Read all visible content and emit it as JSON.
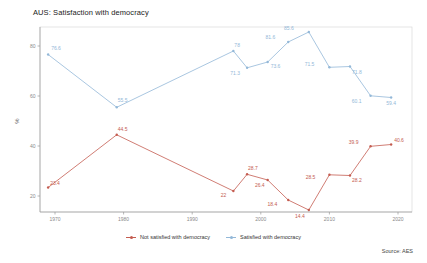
{
  "title": "AUS: Satisfaction with democracy",
  "source": "Source: AES",
  "legend": {
    "not_satisfied_label": "Not satisfied with democracy",
    "satisfied_label": "Satisfied with democracy"
  },
  "colors": {
    "not_satisfied": "#c45c50",
    "satisfied": "#93b8d8",
    "axis": "#9a9a9a",
    "panel_border": "#d9d9d9",
    "tick_text": "#8a8a8a"
  },
  "chart_data": {
    "type": "line",
    "title": "AUS: Satisfaction with democracy",
    "xlabel": "",
    "ylabel": "%",
    "x": [
      1969,
      1979,
      1996,
      1998,
      2001,
      2004,
      2007,
      2010,
      2013,
      2016,
      2019
    ],
    "series": [
      {
        "name": "Not satisfied with democracy",
        "color": "#c45c50",
        "values": [
          23.4,
          44.5,
          22,
          28.7,
          26.4,
          18.4,
          14.4,
          28.5,
          28.2,
          39.9,
          40.6
        ]
      },
      {
        "name": "Satisfied with democracy",
        "color": "#93b8d8",
        "values": [
          76.6,
          55.5,
          78,
          71.3,
          73.6,
          81.6,
          85.6,
          71.5,
          71.8,
          60.1,
          59.4
        ]
      }
    ],
    "xticks": [
      1970,
      1980,
      1990,
      2000,
      2010,
      2020
    ],
    "yticks": [
      20,
      40,
      60,
      80
    ],
    "xlim": [
      1967.8,
      2022
    ],
    "ylim": [
      13.6,
      87.6
    ],
    "grid": false,
    "legend_position": "bottom",
    "point_labels_shown": true,
    "source": "Source: AES"
  }
}
